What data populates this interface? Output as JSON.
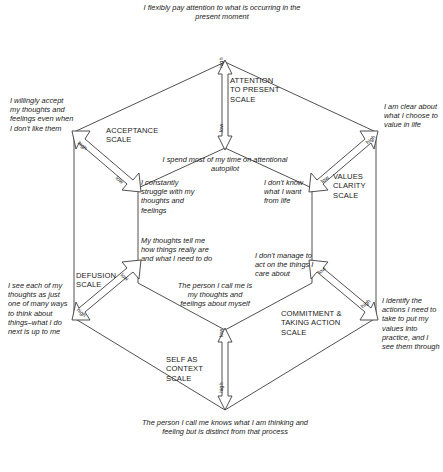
{
  "diagram": {
    "type": "nested-hexagon",
    "axis_labels": {
      "high": "high",
      "low": "low"
    },
    "scales": [
      {
        "id": "attention-to-present",
        "name": "ATTENTION TO PRESENT SCALE",
        "position": "top",
        "high_pole_text": "I flexibly pay attention to what is occurring in the present moment",
        "low_pole_text": "I spend most of my time on attentional autopilot",
        "arrow_high_end": "top",
        "arrow_low_end": "bottom"
      },
      {
        "id": "acceptance",
        "name": "ACCEPTANCE SCALE",
        "position": "upper-left",
        "high_pole_text": "I willingly accept my thoughts and feelings even when I don't like them",
        "low_pole_text": "I constantly struggle with my thoughts and feelings",
        "arrow_high_end": "upper-left",
        "arrow_low_end": "lower-right"
      },
      {
        "id": "values-clarity",
        "name": "VALUES CLARITY SCALE",
        "position": "upper-right",
        "high_pole_text": "I am clear about what I choose to value in life",
        "low_pole_text": "I don't know what I want from life",
        "arrow_high_end": "upper-right",
        "arrow_low_end": "lower-left"
      },
      {
        "id": "defusion",
        "name": "DEFUSION SCALE",
        "position": "lower-left",
        "high_pole_text": "I see each of my thoughts as just one of many ways to think about things–what I do next is up to me",
        "low_pole_text": "My thoughts tell me how things really are and what I need to do",
        "arrow_high_end": "lower-left",
        "arrow_low_end": "upper-right"
      },
      {
        "id": "commitment-taking-action",
        "name": "COMMITMENT & TAKING ACTION SCALE",
        "position": "lower-right",
        "high_pole_text": "I identify the actions I need to take to put my values into practice, and I see them through",
        "low_pole_text": "I don't manage to act on the things I care about",
        "arrow_high_end": "lower-right",
        "arrow_low_end": "upper-left"
      },
      {
        "id": "self-as-context",
        "name": "SELF AS CONTEXT SCALE",
        "position": "bottom",
        "high_pole_text": "The person I call me knows what I am thinking and feeling but is distinct from that process",
        "low_pole_text": "The person I call me is my thoughts and feelings about myself",
        "arrow_high_end": "bottom",
        "arrow_low_end": "top"
      }
    ],
    "scale_name_lines": {
      "attention": [
        "ATTENTION",
        "TO PRESENT",
        "SCALE"
      ],
      "acceptance": [
        "ACCEPTANCE",
        "SCALE"
      ],
      "values": [
        "VALUES",
        "CLARITY",
        "SCALE"
      ],
      "defusion": [
        "DEFUSION",
        "SCALE"
      ],
      "commitment": [
        "COMMITMENT &",
        "TAKING ACTION",
        "SCALE"
      ],
      "selfcontext": [
        "SELF AS",
        "CONTEXT",
        "SCALE"
      ]
    },
    "colors": {
      "line": "#3d3d3d",
      "text": "#1a1a1a",
      "background": "#ffffff"
    }
  }
}
